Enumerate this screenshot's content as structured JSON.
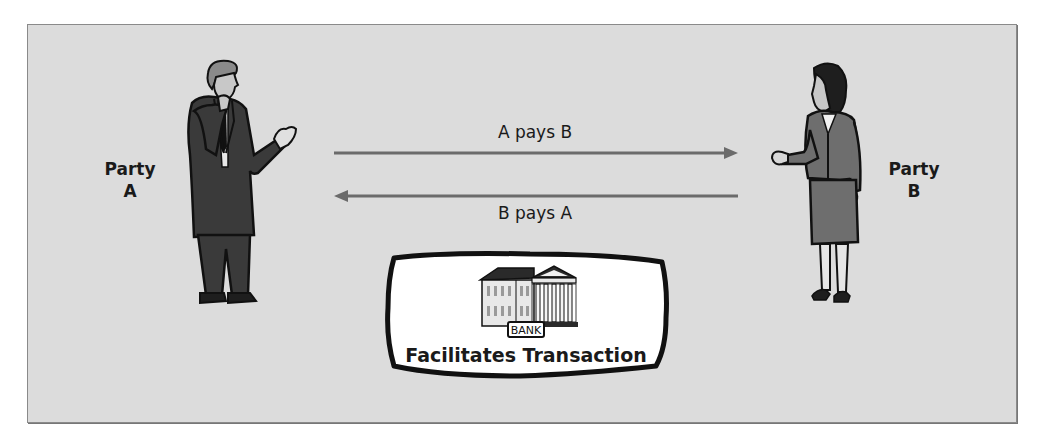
{
  "diagram": {
    "title": "",
    "party_a": {
      "line1": "Party",
      "line2": "A"
    },
    "party_b": {
      "line1": "Party",
      "line2": "B"
    },
    "arrows": [
      {
        "label": "A pays B",
        "direction": "right",
        "from": "Party A",
        "to": "Party B"
      },
      {
        "label": "B pays A",
        "direction": "left",
        "from": "Party B",
        "to": "Party A"
      }
    ],
    "intermediary": {
      "icon": "bank-building-icon",
      "sign_text": "BANK",
      "caption": "Facilitates Transaction"
    },
    "colors": {
      "panel_background": "#dcdcdc",
      "panel_border": "#8a8a8a",
      "arrow": "#6b6b6b",
      "suit_dark": "#3a3a3a",
      "jacket_mid": "#6e6e6e",
      "text": "#1a1a1a"
    }
  }
}
